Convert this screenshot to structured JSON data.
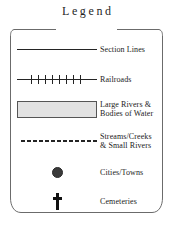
{
  "legend": {
    "title": "Legend",
    "border_color": "#6b6b6b",
    "ink_color": "#1a1a1a",
    "rows": [
      {
        "symbol": "solid-line",
        "label_lines": [
          "Section Lines"
        ],
        "symbol_color": "#242424"
      },
      {
        "symbol": "railroad-line",
        "label_lines": [
          "Railroads"
        ],
        "symbol_color": "#242424"
      },
      {
        "symbol": "filled-rectangle",
        "label_lines": [
          "Large Rivers &",
          "Bodies of Water"
        ],
        "symbol_color": "#e2e2e2",
        "symbol_border_color": "#555555"
      },
      {
        "symbol": "dashed-line",
        "label_lines": [
          "Streams/Creeks",
          "& Small Rivers"
        ],
        "symbol_color": "#242424"
      },
      {
        "symbol": "filled-circle",
        "label_lines": [
          "Cities/Towns"
        ],
        "symbol_color": "#3a3a3a"
      },
      {
        "symbol": "cross",
        "label_lines": [
          "Cemeteries"
        ],
        "symbol_color": "#111111"
      }
    ]
  }
}
